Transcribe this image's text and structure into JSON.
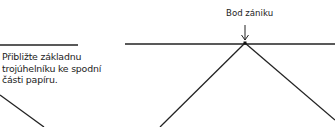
{
  "diagram": {
    "instruction_text": "Přibližte základnu trojúhelníku ke spodní části papíru.",
    "vanishing_point_label": "Bod zániku",
    "colors": {
      "line": "#222222",
      "background": "#ffffff"
    },
    "elements": {
      "left_panel": {
        "horizon_line": [
          [
            0,
            45
          ],
          [
            78,
            45
          ]
        ],
        "triangle_edge": [
          [
            0,
            95
          ],
          [
            44,
            127
          ]
        ]
      },
      "right_panel": {
        "horizon_line": [
          [
            125,
            44
          ],
          [
            335,
            44
          ]
        ],
        "vanishing_point": [
          245,
          43
        ],
        "left_edge": [
          [
            245,
            43
          ],
          [
            160,
            127
          ]
        ],
        "right_edge": [
          [
            245,
            43
          ],
          [
            335,
            120
          ]
        ],
        "arrow": [
          [
            245,
            25
          ],
          [
            245,
            41
          ]
        ]
      }
    }
  }
}
